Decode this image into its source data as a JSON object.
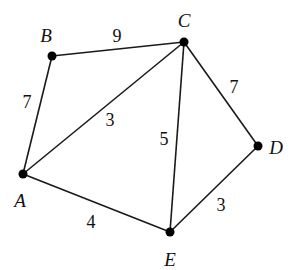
{
  "diagram": {
    "type": "weighted-undirected-graph",
    "nodes": [
      {
        "id": "A",
        "label": "A",
        "x": 23,
        "y": 174,
        "label_x": 20,
        "label_y": 207
      },
      {
        "id": "B",
        "label": "B",
        "x": 52,
        "y": 56,
        "label_x": 46,
        "label_y": 42
      },
      {
        "id": "C",
        "label": "C",
        "x": 184,
        "y": 42,
        "label_x": 184,
        "label_y": 27
      },
      {
        "id": "D",
        "label": "D",
        "x": 258,
        "y": 146,
        "label_x": 276,
        "label_y": 154
      },
      {
        "id": "E",
        "label": "E",
        "x": 170,
        "y": 232,
        "label_x": 170,
        "label_y": 266
      }
    ],
    "edges": [
      {
        "from": "A",
        "to": "B",
        "weight": "7",
        "label_x": 27,
        "label_y": 108
      },
      {
        "from": "B",
        "to": "C",
        "weight": "9",
        "label_x": 117,
        "label_y": 42
      },
      {
        "from": "A",
        "to": "C",
        "weight": "3",
        "label_x": 110,
        "label_y": 126
      },
      {
        "from": "C",
        "to": "E",
        "weight": "5",
        "label_x": 164,
        "label_y": 145
      },
      {
        "from": "C",
        "to": "D",
        "weight": "7",
        "label_x": 234,
        "label_y": 93
      },
      {
        "from": "A",
        "to": "E",
        "weight": "4",
        "label_x": 91,
        "label_y": 228
      },
      {
        "from": "E",
        "to": "D",
        "weight": "3",
        "label_x": 221,
        "label_y": 211
      }
    ],
    "colors": {
      "edge": "#1a1a1a",
      "node": "#000000",
      "background": "#ffffff"
    }
  }
}
